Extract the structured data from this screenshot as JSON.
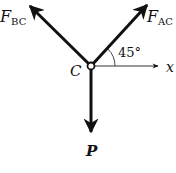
{
  "diagram": {
    "type": "free-body-diagram",
    "node": {
      "label": "C"
    },
    "forces": [
      {
        "id": "fbc",
        "symbol": "F",
        "subscript": "BC",
        "direction": "up-left"
      },
      {
        "id": "fac",
        "symbol": "F",
        "subscript": "AC",
        "direction": "up-right"
      },
      {
        "id": "p",
        "symbol": "P",
        "direction": "down"
      }
    ],
    "axis": {
      "label": "x",
      "direction": "right"
    },
    "angle": {
      "label": "45°",
      "between": [
        "F_AC",
        "x"
      ]
    },
    "colors": {
      "ink": "#111111",
      "axis": "#333333",
      "background": "#ffffff"
    }
  }
}
